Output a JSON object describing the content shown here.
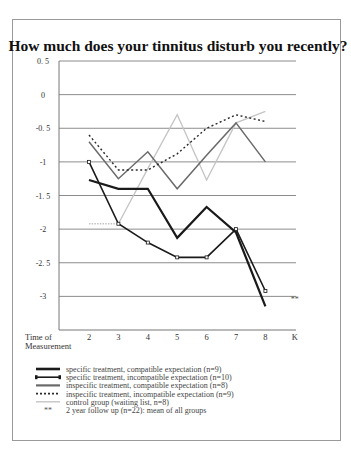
{
  "chart_data": {
    "type": "line",
    "title": "How much does your tinnitus disturb you recently?",
    "xlabel": "Time of Measurement",
    "xlabel_lines": [
      "Time of",
      "Measurement"
    ],
    "ylabel": "",
    "categories": [
      "2",
      "3",
      "4",
      "5",
      "6",
      "7",
      "8",
      "K"
    ],
    "ylim": [
      -3.5,
      0.5
    ],
    "yticks": [
      0.5,
      0,
      -0.5,
      -1,
      -1.5,
      -2,
      -2.5,
      -3
    ],
    "ytick_labels": [
      "0. 5",
      "0",
      "-0. 5",
      "-1",
      "-1. 5",
      "-2",
      "-2. 5",
      "-3"
    ],
    "grid": true,
    "legend_position": "bottom",
    "series": [
      {
        "name": "specific treatment, compatible expectation (n=9)",
        "style": "thick-solid",
        "color": "#1a1a1a",
        "values": [
          -1.27,
          -1.4,
          -1.4,
          -2.13,
          -1.67,
          -2.05,
          -3.15,
          null
        ]
      },
      {
        "name": "specific treatment, incompatible expectation (n=10)",
        "style": "solid-markers",
        "color": "#1a1a1a",
        "values": [
          -1.0,
          -1.92,
          -2.2,
          -2.42,
          -2.42,
          -2.0,
          -2.92,
          null
        ]
      },
      {
        "name": "inspecific treatment, compatible expectation (n=8)",
        "style": "medium-solid",
        "color": "#6a6a6a",
        "values": [
          -0.7,
          -1.25,
          -0.85,
          -1.4,
          -0.9,
          -0.42,
          -1.0,
          null
        ]
      },
      {
        "name": "inspecific treatment, incompatible expectation (n=9)",
        "style": "dotted",
        "color": "#2a2a2a",
        "values": [
          -0.6,
          -1.12,
          -1.12,
          -0.88,
          -0.5,
          -0.3,
          -0.4,
          null
        ]
      },
      {
        "name": "control group (waiting list, n=8)",
        "style": "light-solid",
        "color": "#c4c4c4",
        "values": [
          -1.92,
          -1.92,
          -1.1,
          -0.3,
          -1.27,
          -0.42,
          -0.25,
          null
        ]
      },
      {
        "name": "2 year follow up (n=22): mean of all groups",
        "style": "asterisk-marker",
        "color": "#555555",
        "marker_label": "**",
        "values": [
          null,
          null,
          null,
          null,
          null,
          null,
          null,
          -3.02
        ]
      }
    ]
  }
}
